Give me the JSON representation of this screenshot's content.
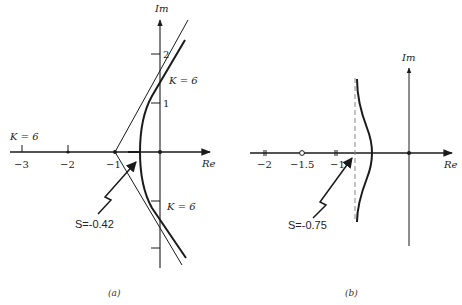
{
  "figure_a": {
    "caption": "(a)",
    "axis_labels": {
      "real": "Re",
      "imag": "Im"
    },
    "real_ticks": [
      "−3",
      "−2",
      "−1"
    ],
    "imag_ticks": [
      "2",
      "1"
    ],
    "gain_labels": [
      "K = 6",
      "K = 6",
      "K = 6"
    ],
    "breakaway_annotation": "S=-0.42",
    "poles": [
      0,
      -1,
      -2,
      -3
    ]
  },
  "figure_b": {
    "caption": "(b)",
    "axis_labels": {
      "real": "Re",
      "imag": "Im"
    },
    "real_ticks": [
      "−2",
      "−1.5",
      "−1"
    ],
    "zero": -1.5,
    "breakaway_annotation": "S=-0.75",
    "asymptote": -0.75
  },
  "colors": {
    "ink": "#1a1a1a",
    "background": "#ffffff",
    "dashed": "#888888"
  }
}
